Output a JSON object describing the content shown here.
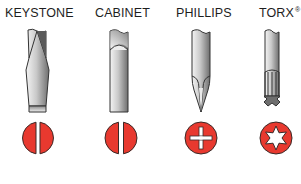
{
  "colors": {
    "screw_red": "#e8392f",
    "outline": "#3a2a28",
    "steel_dark": "#7c7c7c",
    "steel_light": "#f2f2f2"
  },
  "types": [
    {
      "label": "KEYSTONE",
      "tip_icon": "keystone-tip-icon",
      "head_icon": "slotted-screw-head-icon"
    },
    {
      "label": "CABINET",
      "tip_icon": "cabinet-tip-icon",
      "head_icon": "slotted-screw-head-icon"
    },
    {
      "label": "PHILLIPS",
      "tip_icon": "phillips-tip-icon",
      "head_icon": "phillips-screw-head-icon"
    },
    {
      "label": "TORX",
      "trademark": "®",
      "tip_icon": "torx-tip-icon",
      "head_icon": "torx-screw-head-icon"
    }
  ]
}
